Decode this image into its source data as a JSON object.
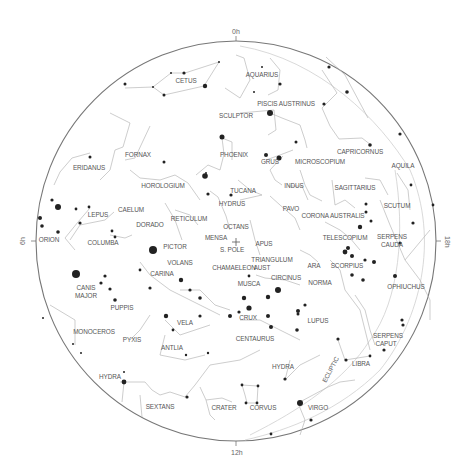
{
  "chart": {
    "type": "planisphere",
    "hemisphere": "southern",
    "center_label": "S. POLE",
    "ecliptic_label": "ECLIPTIC",
    "hour_markers": [
      {
        "label": "0h",
        "position": "top"
      },
      {
        "label": "6h",
        "position": "left"
      },
      {
        "label": "12h",
        "position": "bottom"
      },
      {
        "label": "18h",
        "position": "right"
      }
    ],
    "colors": {
      "background": "#ffffff",
      "horizon": "#777777",
      "lines": "#b8b8b8",
      "stars": "#222222",
      "labels": "#555555"
    }
  },
  "labels": {
    "top": "0h",
    "left": "6h",
    "bottom": "12h",
    "right": "18h",
    "s_pole": "S. POLE",
    "ecliptic": "ECLIPTIC"
  },
  "constellations": [
    {
      "name": "CETUS",
      "x": 186,
      "y": 83
    },
    {
      "name": "AQUARIUS",
      "x": 262,
      "y": 77
    },
    {
      "name": "PISCIS AUSTRINUS",
      "x": 286,
      "y": 106
    },
    {
      "name": "SCULPTOR",
      "x": 236,
      "y": 118
    },
    {
      "name": "CAPRICORNUS",
      "x": 360,
      "y": 154
    },
    {
      "name": "AQUILA",
      "x": 403,
      "y": 168
    },
    {
      "name": "FORNAX",
      "x": 138,
      "y": 157
    },
    {
      "name": "PHOENIX",
      "x": 234,
      "y": 157
    },
    {
      "name": "GRUS",
      "x": 270,
      "y": 164
    },
    {
      "name": "MICROSCOPIUM",
      "x": 320,
      "y": 164
    },
    {
      "name": "ERIDANUS",
      "x": 89,
      "y": 170
    },
    {
      "name": "HOROLOGIUM",
      "x": 163,
      "y": 188
    },
    {
      "name": "TUCANA",
      "x": 243,
      "y": 193
    },
    {
      "name": "INDUS",
      "x": 294,
      "y": 188
    },
    {
      "name": "SAGITTARIUS",
      "x": 355,
      "y": 190
    },
    {
      "name": "SCUTUM",
      "x": 397,
      "y": 208
    },
    {
      "name": "HYDRUS",
      "x": 232,
      "y": 206
    },
    {
      "name": "PAVO",
      "x": 291,
      "y": 211
    },
    {
      "name": "CORONA AUSTRALIS",
      "x": 333,
      "y": 218
    },
    {
      "name": "LEPUS",
      "x": 98,
      "y": 217
    },
    {
      "name": "CAELUM",
      "x": 131,
      "y": 212
    },
    {
      "name": "RETICULUM",
      "x": 189,
      "y": 221
    },
    {
      "name": "OCTANS",
      "x": 236,
      "y": 229
    },
    {
      "name": "DORADO",
      "x": 150,
      "y": 227
    },
    {
      "name": "TELESCOPIUM",
      "x": 345,
      "y": 240
    },
    {
      "name": "SERPENS",
      "x": 392,
      "y": 239
    },
    {
      "name": "CAUDA",
      "x": 392,
      "y": 247
    },
    {
      "name": "ORION",
      "x": 49,
      "y": 242
    },
    {
      "name": "COLUMBA",
      "x": 103,
      "y": 245
    },
    {
      "name": "MENSA",
      "x": 216,
      "y": 240
    },
    {
      "name": "APUS",
      "x": 264,
      "y": 246
    },
    {
      "name": "PICTOR",
      "x": 175,
      "y": 249
    },
    {
      "name": "TRIANGULUM",
      "x": 272,
      "y": 262
    },
    {
      "name": "AUST",
      "x": 262,
      "y": 270
    },
    {
      "name": "ARA",
      "x": 314,
      "y": 268
    },
    {
      "name": "SCORPIUS",
      "x": 347,
      "y": 268
    },
    {
      "name": "VOLANS",
      "x": 180,
      "y": 265
    },
    {
      "name": "CHAMAELEON",
      "x": 234,
      "y": 270
    },
    {
      "name": "CIRCINUS",
      "x": 286,
      "y": 280
    },
    {
      "name": "NORMA",
      "x": 320,
      "y": 285
    },
    {
      "name": "OPHIUCHUS",
      "x": 406,
      "y": 289
    },
    {
      "name": "CARINA",
      "x": 162,
      "y": 276
    },
    {
      "name": "CANIS",
      "x": 86,
      "y": 290
    },
    {
      "name": "MAJOR",
      "x": 86,
      "y": 298
    },
    {
      "name": "MUSCA",
      "x": 249,
      "y": 286
    },
    {
      "name": "PUPPIS",
      "x": 122,
      "y": 310
    },
    {
      "name": "CRUX",
      "x": 248,
      "y": 320
    },
    {
      "name": "LUPUS",
      "x": 318,
      "y": 323
    },
    {
      "name": "MONOCEROS",
      "x": 94,
      "y": 334
    },
    {
      "name": "VELA",
      "x": 185,
      "y": 325
    },
    {
      "name": "CENTAURUS",
      "x": 255,
      "y": 341
    },
    {
      "name": "SERPENS",
      "x": 388,
      "y": 338
    },
    {
      "name": "CAPUT",
      "x": 386,
      "y": 346
    },
    {
      "name": "PYXIS",
      "x": 132,
      "y": 342
    },
    {
      "name": "ANTLIA",
      "x": 172,
      "y": 350
    },
    {
      "name": "LIBRA",
      "x": 361,
      "y": 366
    },
    {
      "name": "HYDRA",
      "x": 283,
      "y": 369
    },
    {
      "name": "HYDRA",
      "x": 110,
      "y": 379
    },
    {
      "name": "SEXTANS",
      "x": 160,
      "y": 409
    },
    {
      "name": "CRATER",
      "x": 224,
      "y": 410
    },
    {
      "name": "CORVUS",
      "x": 263,
      "y": 410
    },
    {
      "name": "VIRGO",
      "x": 318,
      "y": 410
    }
  ]
}
